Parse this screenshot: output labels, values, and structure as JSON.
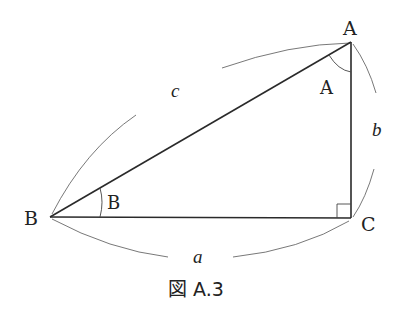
{
  "figure": {
    "caption": "図 A.3",
    "type": "right-triangle"
  },
  "vertices": {
    "A": {
      "label": "A",
      "x": 351,
      "y": 42
    },
    "B": {
      "label": "B",
      "x": 50,
      "y": 217
    },
    "C": {
      "label": "C",
      "x": 351,
      "y": 218
    }
  },
  "angle_labels": {
    "A": "A",
    "B": "B"
  },
  "side_labels": {
    "a": "a",
    "b": "b",
    "c": "c"
  },
  "right_angle_at": "C",
  "colors": {
    "line": "#2a2a2a",
    "arc": "#555555",
    "text": "#222222",
    "background": "#ffffff"
  }
}
